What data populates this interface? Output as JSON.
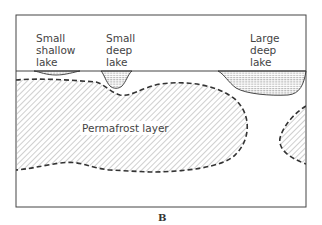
{
  "figure": {
    "panel_label": "B",
    "labels": {
      "small_shallow_lake": [
        "Small",
        "shallow",
        "lake"
      ],
      "small_deep_lake": [
        "Small",
        "deep",
        "lake"
      ],
      "large_deep_lake": [
        "Large",
        "deep",
        "lake"
      ],
      "permafrost": "Permafrost layer"
    }
  },
  "colors": {
    "line": "#333333",
    "hatch": "#9a9a9a",
    "water_hatch": "#777777",
    "background": "#ffffff"
  }
}
